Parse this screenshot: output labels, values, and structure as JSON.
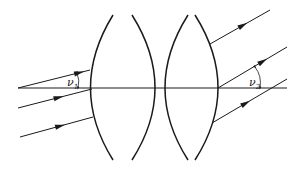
{
  "diagram": {
    "type": "optics-two-lens-ray-diagram",
    "colors": {
      "stroke": "#1a1a1a",
      "background": "#ffffff"
    },
    "optical_axis": {
      "x1": 18,
      "y1": 88,
      "x2": 287,
      "y2": 88
    },
    "lenses": [
      {
        "name": "lens-1",
        "left_arc": "M113,15 Q68,88 113,160",
        "right_arc": "M132,15 Q178,88 132,160"
      },
      {
        "name": "lens-2",
        "left_arc": "M188,15 Q142,88 188,160",
        "right_arc": "M195,15 Q241,88 195,160"
      }
    ],
    "incoming_rays": [
      {
        "x1": 18,
        "y1": 88,
        "x2": 90,
        "y2": 70,
        "arrow_at": 0.85
      },
      {
        "x1": 18,
        "y1": 108,
        "x2": 92,
        "y2": 89,
        "arrow_at": 0.55
      },
      {
        "x1": 20,
        "y1": 137,
        "x2": 93,
        "y2": 117,
        "arrow_at": 0.55
      }
    ],
    "outgoing_rays": [
      {
        "x1": 210,
        "y1": 44,
        "x2": 270,
        "y2": 10,
        "arrow_at": 0.55
      },
      {
        "x1": 218,
        "y1": 88,
        "x2": 287,
        "y2": 47,
        "arrow_at": 0.65
      },
      {
        "x1": 212,
        "y1": 123,
        "x2": 287,
        "y2": 79,
        "arrow_at": 0.45
      }
    ],
    "angle_labels": [
      {
        "symbol": "ν",
        "subscript": "1",
        "x": 67,
        "y": 86
      },
      {
        "symbol": "ν",
        "subscript": "2",
        "x": 252,
        "y": 87
      }
    ]
  }
}
